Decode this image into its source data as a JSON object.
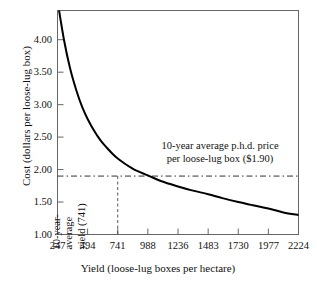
{
  "chart_data": {
    "type": "line",
    "title": "",
    "xlabel": "Yield (loose-lug boxes per hectare)",
    "ylabel": "Cost (dollars per loose-lug box)",
    "xlim": [
      247,
      2224
    ],
    "ylim": [
      1.0,
      4.45
    ],
    "grid": false,
    "legend": "none",
    "x_ticks": [
      247,
      494,
      741,
      988,
      1236,
      1483,
      1730,
      1977,
      2224
    ],
    "x_tick_labels": [
      "247",
      "494",
      "741",
      "988",
      "1236",
      "1483",
      "1730",
      "1977",
      "2224"
    ],
    "y_ticks": [
      1.0,
      1.5,
      2.0,
      2.5,
      3.0,
      3.5,
      4.0
    ],
    "y_tick_labels": [
      "1.00",
      "1.50",
      "2.00",
      "2.50",
      "3.00",
      "3.50",
      "4.00"
    ],
    "series": [
      {
        "name": "Cost per loose-lug box",
        "x": [
          247,
          300,
          350,
          400,
          450,
          494,
          550,
          600,
          650,
          700,
          741,
          800,
          850,
          900,
          988,
          1100,
          1236,
          1350,
          1483,
          1600,
          1730,
          1850,
          1977,
          2100,
          2224
        ],
        "values": [
          4.6,
          4.0,
          3.56,
          3.23,
          2.96,
          2.78,
          2.59,
          2.45,
          2.34,
          2.24,
          2.17,
          2.09,
          2.03,
          1.98,
          1.91,
          1.82,
          1.74,
          1.68,
          1.62,
          1.56,
          1.5,
          1.45,
          1.4,
          1.34,
          1.3
        ]
      }
    ],
    "annotations": [
      {
        "name": "price-reference-line",
        "type": "hline",
        "y": 1.9,
        "style": "dash-dot",
        "label_lines": [
          "10-year average p.h.d. price",
          "per loose-lug box ($1.90)"
        ]
      },
      {
        "name": "yield-reference-line",
        "type": "vline",
        "x": 741,
        "style": "dashed",
        "label_lines": [
          "10-year-",
          "average",
          "yield (741)"
        ]
      }
    ],
    "colors": {
      "curve": "#000000",
      "frame": "#555555",
      "reference_line": "#333333",
      "text": "#111111",
      "background": "#ffffff"
    }
  }
}
